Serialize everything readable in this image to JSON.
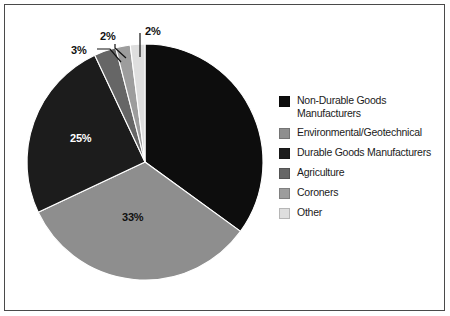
{
  "chart_data": {
    "type": "pie",
    "title": "",
    "subtitle": "",
    "xlabel": "",
    "ylabel": "",
    "legend_position": "right",
    "grid": false,
    "start_angle_deg": 0,
    "direction": "clockwise",
    "categories": [
      "Non-Durable Goods Manufacturers",
      "Environmental/Geotechnical",
      "Durable Goods Manufacturers",
      "Agriculture",
      "Coroners",
      "Other"
    ],
    "values": [
      35,
      33,
      25,
      3,
      2,
      2
    ],
    "value_labels": [
      "",
      "33%",
      "25%",
      "3%",
      "2%",
      "2%"
    ],
    "colors": [
      "#0d0d0d",
      "#8e8e8e",
      "#1c1c1c",
      "#666666",
      "#9d9d9d",
      "#dedede"
    ]
  },
  "chart": {
    "slices": [
      {
        "name": "Non-Durable Goods Manufacturers",
        "value": 35,
        "label": "",
        "color": "#0d0d0d",
        "label_style": "hidden"
      },
      {
        "name": "Environmental/Geotechnical",
        "value": 33,
        "label": "33%",
        "color": "#8e8e8e",
        "label_style": "inside-dark"
      },
      {
        "name": "Durable Goods Manufacturers",
        "value": 25,
        "label": "25%",
        "color": "#1c1c1c",
        "label_style": "inside-light"
      },
      {
        "name": "Agriculture",
        "value": 3,
        "label": "3%",
        "color": "#666666",
        "label_style": "outside-leader"
      },
      {
        "name": "Coroners",
        "value": 2,
        "label": "2%",
        "color": "#9d9d9d",
        "label_style": "outside-leader"
      },
      {
        "name": "Other",
        "value": 2,
        "label": "2%",
        "color": "#dedede",
        "label_style": "outside-leader"
      }
    ]
  },
  "legend": {
    "items": [
      {
        "label": "Non-Durable Goods Manufacturers",
        "color": "#0d0d0d"
      },
      {
        "label": "Environmental/Geotechnical",
        "color": "#8e8e8e"
      },
      {
        "label": "Durable Goods Manufacturers",
        "color": "#1c1c1c"
      },
      {
        "label": "Agriculture",
        "color": "#666666"
      },
      {
        "label": "Coroners",
        "color": "#9d9d9d"
      },
      {
        "label": "Other",
        "color": "#dedede"
      }
    ]
  },
  "style": {
    "background": "#ffffff",
    "border_color": "#4a4a4a",
    "slice_outline": "#ffffff"
  }
}
